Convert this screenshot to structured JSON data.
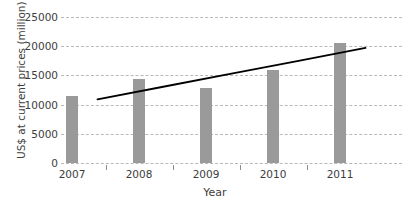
{
  "chart_data": {
    "type": "bar",
    "title": "",
    "xlabel": "Year",
    "ylabel": "US$ at current prices (million)",
    "categories": [
      "2007",
      "2008",
      "2009",
      "2010",
      "2011"
    ],
    "values": [
      11400,
      14400,
      12900,
      15900,
      20500
    ],
    "series": [
      {
        "name": "US$ at current prices (million)",
        "type": "bar",
        "color": "#9a9a9a",
        "values": [
          11400,
          14400,
          12900,
          15900,
          20500
        ]
      },
      {
        "name": "Trend line",
        "type": "line",
        "color": "#000000",
        "values": [
          10900,
          13100,
          15300,
          17500,
          19700
        ]
      }
    ],
    "yticks": [
      0,
      5000,
      10000,
      15000,
      20000,
      25000
    ],
    "ytick_labels": [
      "0",
      "5000",
      "10000",
      "15000",
      "20000",
      "25000"
    ],
    "ylim": [
      0,
      25000
    ],
    "grid": "horizontal-dashed",
    "legend": "none",
    "colors": {
      "bar": "#9a9a9a",
      "trendline": "#000000",
      "gridline": "#b9b9b9",
      "text": "#3d3d3d",
      "background": "#ffffff"
    }
  }
}
